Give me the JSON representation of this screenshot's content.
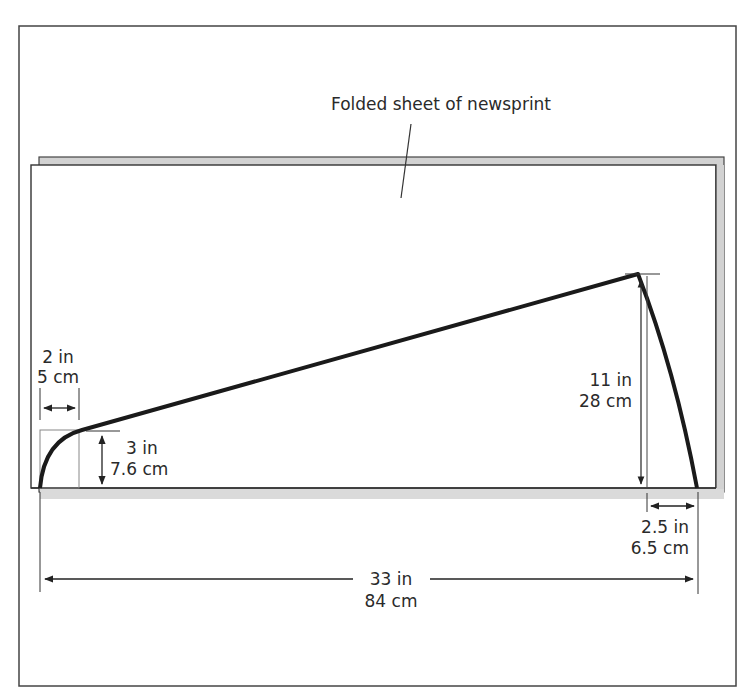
{
  "title_label": "Folded sheet of newsprint",
  "dimensions": {
    "top_width": {
      "in": "2 in",
      "cm": "5 cm"
    },
    "left_height": {
      "in": "3 in",
      "cm": "7.6 cm"
    },
    "right_height": {
      "in": "11 in",
      "cm": "28 cm"
    },
    "bottom_right_offset": {
      "in": "2.5 in",
      "cm": "6.5 cm"
    },
    "total_length": {
      "in": "33 in",
      "cm": "84 cm"
    }
  },
  "colors": {
    "outline": "#333333",
    "shadow": "#cfcfcf",
    "cut_line": "#1a1a1a",
    "background": "#ffffff"
  }
}
